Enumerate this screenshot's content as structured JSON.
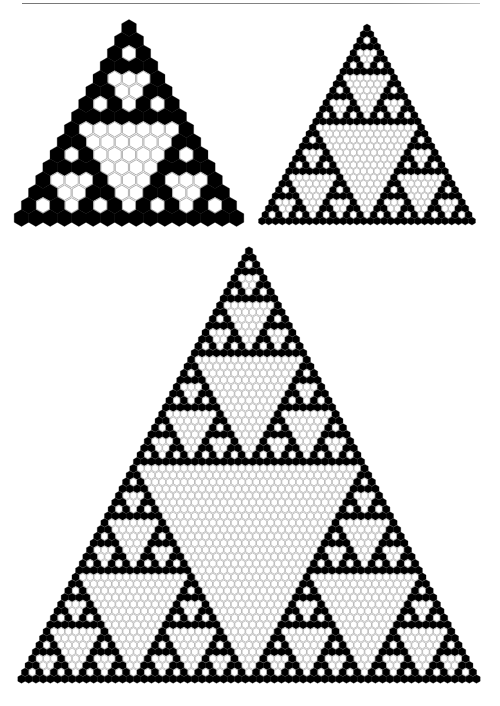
{
  "page": {
    "rule_color": "#808080"
  },
  "colors": {
    "odd_fill": "#000000",
    "even_fill": "#ffffff",
    "even_stroke": "#a8a8a8",
    "background": "#ffffff"
  },
  "figures": [
    {
      "name": "pascal-triangle-16-rows",
      "rows": 16,
      "modulus": 2,
      "apex": [
        129,
        28
      ],
      "base_y": 218,
      "base_left_x": 22,
      "base_right_x": 237,
      "cell_shape": "hexagon"
    },
    {
      "name": "pascal-triangle-32-rows",
      "rows": 32,
      "modulus": 2,
      "apex": [
        367,
        28
      ],
      "base_y": 221,
      "base_left_x": 262,
      "base_right_x": 472,
      "cell_shape": "hexagon"
    },
    {
      "name": "pascal-triangle-64-rows",
      "rows": 64,
      "modulus": 2,
      "apex": [
        249,
        251
      ],
      "base_y": 679,
      "base_left_x": 22,
      "base_right_x": 477,
      "cell_shape": "hexagon"
    }
  ]
}
